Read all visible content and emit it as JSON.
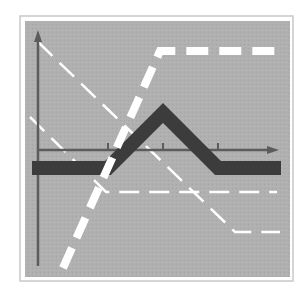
{
  "diagram": {
    "type": "option-payoff-diagram",
    "colors": {
      "page_background": "#ffffff",
      "frame_border": "#c8c8c8",
      "plot_background": "#b0b0b0",
      "axis": "#5c5c5c",
      "payoff_band": "#3c3c3c",
      "leg_lines": "#ffffff"
    },
    "axes": {
      "y_axis": {
        "x": 38,
        "y_top": 30,
        "y_bottom": 266
      },
      "x_axis": {
        "y": 150,
        "x_left": 38,
        "x_right": 279
      },
      "ticks_x": [
        108,
        163,
        218
      ]
    },
    "series": [
      {
        "name": "butterfly-net-payoff",
        "style": "thick-solid-dark",
        "points": [
          [
            32,
            168
          ],
          [
            108,
            168
          ],
          [
            163,
            113
          ],
          [
            218,
            168
          ],
          [
            281,
            168
          ]
        ]
      },
      {
        "name": "long-call-steep-leg",
        "style": "thick-dashed-white",
        "points": [
          [
            63,
            268
          ],
          [
            160,
            51
          ],
          [
            280,
            51
          ]
        ]
      },
      {
        "name": "short-put-leg-upper",
        "style": "thin-dashed-white",
        "points": [
          [
            38,
            42
          ],
          [
            235,
            232
          ],
          [
            280,
            232
          ]
        ]
      },
      {
        "name": "short-put-leg-lower",
        "style": "thin-dashed-white",
        "points": [
          [
            30,
            117
          ],
          [
            106,
            192
          ],
          [
            277,
            192
          ]
        ]
      }
    ]
  }
}
